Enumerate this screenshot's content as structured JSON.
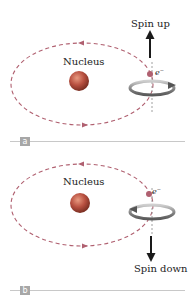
{
  "panels": [
    {
      "id": "a",
      "tag": "a",
      "nucleus_label": "Nucleus",
      "electron_label": "e⁻",
      "spin_label": "Spin up",
      "spin_direction": "up"
    },
    {
      "id": "b",
      "tag": "b",
      "nucleus_label": "Nucleus",
      "electron_label": "e⁻",
      "spin_label": "Spin down",
      "spin_direction": "down"
    }
  ],
  "colors": {
    "orbit": "#b06070",
    "nucleus": "#b85040",
    "arrow": "#1a1a1a",
    "spin_ring": "#888888",
    "tag_bg": "#a7a7a7",
    "rule": "#c8c8c8"
  }
}
